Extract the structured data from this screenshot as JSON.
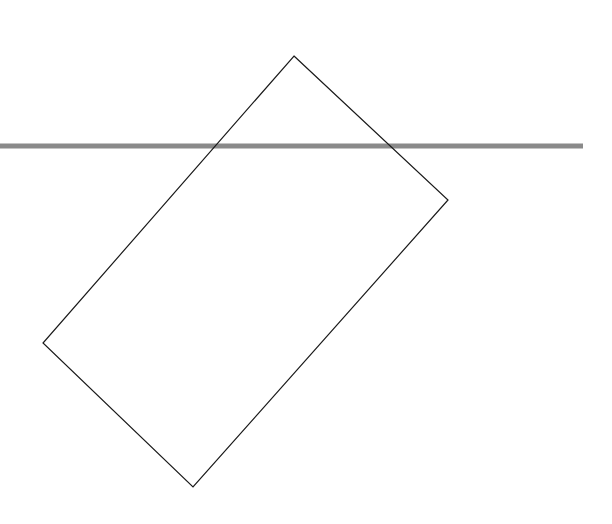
{
  "canvas": {
    "width": 612,
    "height": 524,
    "background": "#ffffff"
  },
  "horizontal_line": {
    "x1": 0,
    "x2": 583,
    "y": 146,
    "thickness": 5,
    "color": "#8a8a8a"
  },
  "rotated_rectangle": {
    "vertices": [
      {
        "name": "top",
        "x": 294,
        "y": 56
      },
      {
        "name": "right",
        "x": 448,
        "y": 200
      },
      {
        "name": "bottom",
        "x": 193,
        "y": 487
      },
      {
        "name": "left",
        "x": 43,
        "y": 343
      }
    ],
    "stroke": "#1a1a1a",
    "stroke_width": 1.2,
    "fill": "none"
  }
}
